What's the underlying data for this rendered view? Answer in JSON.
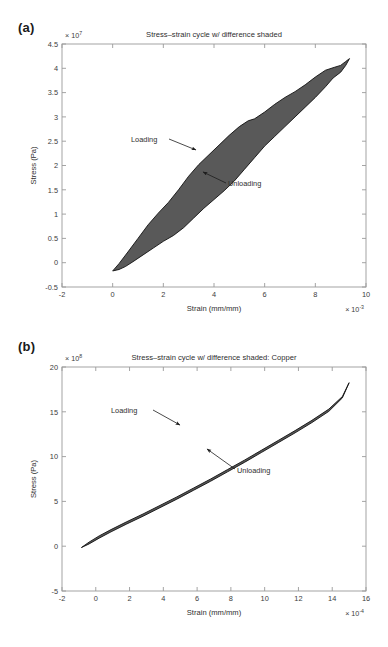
{
  "figure": {
    "panels": [
      {
        "key": "a",
        "label": "(a)",
        "title": "Stress–strain cycle w/ difference shaded",
        "xlabel": "Strain (mm/mm)",
        "ylabel": "Stress (Pa)",
        "x_exponent_prefix": "× 10",
        "x_exponent_power": "-3",
        "y_exponent_prefix": "× 10",
        "y_exponent_power": "7",
        "annotations": [
          {
            "text": "Loading",
            "target": "upper-boundary"
          },
          {
            "text": "Unloading",
            "target": "lower-boundary"
          }
        ]
      },
      {
        "key": "b",
        "label": "(b)",
        "title": "Stress–strain cycle w/ difference shaded: Copper",
        "xlabel": "Strain (mm/mm)",
        "ylabel": "Stress (Pa)",
        "x_exponent_prefix": "× 10",
        "x_exponent_power": "-4",
        "y_exponent_prefix": "× 10",
        "y_exponent_power": "8",
        "annotations": [
          {
            "text": "Loading",
            "target": "upper-boundary"
          },
          {
            "text": "Unloading",
            "target": "lower-boundary"
          }
        ]
      }
    ]
  },
  "colors": {
    "shaded_region": "#595959",
    "axis": "#9a9a9a",
    "text": "#2e2e2e",
    "background": "#ffffff"
  },
  "chart_data": [
    {
      "type": "area",
      "panel": "a",
      "title": "Stress–strain cycle w/ difference shaded",
      "xlabel": "Strain (mm/mm)",
      "ylabel": "Stress (Pa)",
      "x_scale_factor": 0.001,
      "y_scale_factor": 10000000.0,
      "xlim": [
        -2,
        10
      ],
      "ylim": [
        -0.5,
        4.5
      ],
      "xticks": [
        -2,
        0,
        2,
        4,
        6,
        8,
        10
      ],
      "yticks": [
        -0.5,
        0,
        0.5,
        1,
        1.5,
        2,
        2.5,
        3,
        3.5,
        4,
        4.5
      ],
      "grid": false,
      "legend": "none",
      "series": [
        {
          "name": "Loading",
          "x": [
            0.0,
            0.25,
            0.6,
            1.0,
            1.4,
            1.8,
            2.2,
            2.6,
            3.0,
            3.4,
            3.8,
            4.2,
            4.6,
            5.0,
            5.35,
            5.6,
            6.0,
            6.4,
            6.8,
            7.2,
            7.6,
            8.0,
            8.4,
            8.75,
            9.0,
            9.2,
            9.35
          ],
          "y": [
            -0.17,
            -0.02,
            0.22,
            0.5,
            0.78,
            1.02,
            1.24,
            1.5,
            1.78,
            2.02,
            2.22,
            2.42,
            2.62,
            2.8,
            2.92,
            2.96,
            3.1,
            3.26,
            3.4,
            3.52,
            3.66,
            3.82,
            3.96,
            4.02,
            4.06,
            4.14,
            4.2
          ]
        },
        {
          "name": "Unloading",
          "x": [
            9.35,
            9.2,
            9.0,
            8.7,
            8.4,
            8.0,
            7.6,
            7.2,
            6.8,
            6.4,
            6.0,
            5.6,
            5.2,
            4.8,
            4.4,
            4.0,
            3.6,
            3.2,
            2.8,
            2.4,
            2.0,
            1.6,
            1.2,
            0.8,
            0.5,
            0.25,
            0.0
          ],
          "y": [
            4.2,
            4.06,
            3.92,
            3.8,
            3.62,
            3.4,
            3.2,
            3.0,
            2.8,
            2.6,
            2.4,
            2.16,
            1.92,
            1.68,
            1.48,
            1.3,
            1.12,
            0.92,
            0.72,
            0.56,
            0.44,
            0.3,
            0.16,
            0.02,
            -0.08,
            -0.14,
            -0.17
          ]
        }
      ],
      "shaded_between": [
        "Loading",
        "Unloading"
      ]
    },
    {
      "type": "area",
      "panel": "b",
      "title": "Stress–strain cycle w/ difference shaded: Copper",
      "xlabel": "Strain (mm/mm)",
      "ylabel": "Stress (Pa)",
      "x_scale_factor": 0.0001,
      "y_scale_factor": 100000000.0,
      "xlim": [
        -2,
        16
      ],
      "ylim": [
        -5,
        20
      ],
      "xticks": [
        -2,
        0,
        2,
        4,
        6,
        8,
        10,
        12,
        14,
        16
      ],
      "yticks": [
        -5,
        0,
        5,
        10,
        15,
        20
      ],
      "grid": false,
      "legend": "none",
      "series": [
        {
          "name": "Loading",
          "x": [
            -0.85,
            -0.4,
            0.2,
            0.9,
            1.8,
            2.8,
            3.8,
            4.8,
            5.8,
            6.8,
            7.8,
            8.8,
            9.8,
            10.8,
            11.8,
            12.8,
            13.8,
            14.6,
            15.0
          ],
          "y": [
            -0.15,
            0.45,
            1.15,
            1.85,
            2.7,
            3.6,
            4.55,
            5.5,
            6.5,
            7.5,
            8.55,
            9.6,
            10.7,
            11.8,
            12.9,
            14.05,
            15.3,
            16.7,
            18.25
          ]
        },
        {
          "name": "Unloading",
          "x": [
            15.0,
            14.6,
            13.8,
            12.8,
            11.8,
            10.8,
            9.8,
            8.8,
            7.8,
            6.8,
            5.8,
            4.8,
            3.8,
            2.8,
            1.8,
            0.9,
            0.2,
            -0.4,
            -0.85
          ],
          "y": [
            18.25,
            16.55,
            15.05,
            13.8,
            12.65,
            11.55,
            10.45,
            9.35,
            8.3,
            7.25,
            6.25,
            5.25,
            4.3,
            3.35,
            2.45,
            1.6,
            0.9,
            0.25,
            -0.15
          ]
        }
      ],
      "shaded_between": [
        "Loading",
        "Unloading"
      ]
    }
  ]
}
